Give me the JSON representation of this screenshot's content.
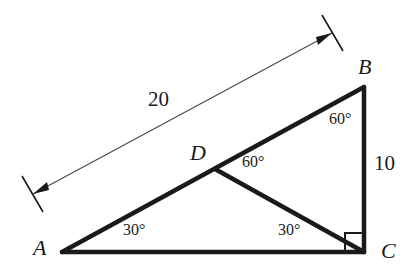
{
  "figure": {
    "type": "geometry-diagram",
    "background_color": "#ffffff",
    "stroke_color": "#1a1a1a",
    "dimension_line_color": "#4a4a4a"
  },
  "vertices": [
    {
      "id": "A",
      "label": "A",
      "x": 62,
      "y": 252,
      "label_x": 33,
      "label_y": 237
    },
    {
      "id": "B",
      "label": "B",
      "x": 364,
      "y": 87,
      "label_x": 358,
      "label_y": 56
    },
    {
      "id": "C",
      "label": "C",
      "x": 364,
      "y": 252,
      "label_x": 381,
      "label_y": 240
    },
    {
      "id": "D",
      "label": "D",
      "x": 215,
      "y": 169,
      "label_x": 190,
      "label_y": 142
    }
  ],
  "segments": [
    {
      "name": "side-AC",
      "from": "A",
      "to": "C",
      "style": "thick"
    },
    {
      "name": "side-AB",
      "from": "A",
      "to": "B",
      "style": "thick"
    },
    {
      "name": "side-BC",
      "from": "B",
      "to": "C",
      "style": "thick"
    },
    {
      "name": "cevian-DC",
      "from": "D",
      "to": "C",
      "style": "thick"
    }
  ],
  "measurements": [
    {
      "name": "length-AB",
      "value": "20",
      "label_x": 148,
      "label_y": 89,
      "dimension_from_x": 33,
      "dimension_from_y": 194,
      "dimension_to_x": 332,
      "dimension_to_y": 33
    },
    {
      "name": "length-BC",
      "value": "10",
      "label_x": 374,
      "label_y": 153
    }
  ],
  "angles": [
    {
      "name": "angle-at-A",
      "value": "30°",
      "label_x": 123,
      "label_y": 222
    },
    {
      "name": "angle-DCA",
      "value": "30°",
      "label_x": 278,
      "label_y": 222
    },
    {
      "name": "angle-BDC",
      "value": "60°",
      "label_x": 242,
      "label_y": 154
    },
    {
      "name": "angle-at-B",
      "value": "60°",
      "label_x": 329,
      "label_y": 111
    },
    {
      "name": "right-angle-at-C",
      "value": "90°",
      "marker": "square"
    }
  ]
}
